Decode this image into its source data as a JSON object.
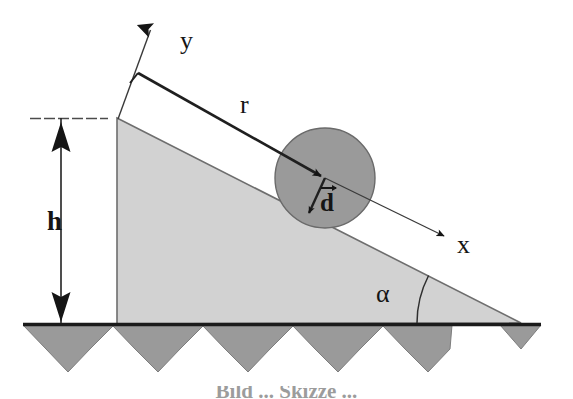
{
  "figure": {
    "background_color": "#ffffff",
    "width": 573,
    "height": 399
  },
  "labels": {
    "y_axis": "y",
    "x_axis": "x",
    "radius": "r",
    "height": "h",
    "angle": "α",
    "displacement": "d"
  },
  "caption": {
    "text": "Bild ... Skizze ...",
    "note": "cropped at bottom edge, only tops of glyphs visible"
  },
  "colors": {
    "ink": "#151515",
    "wedge_fill": "#d2d2d2",
    "wedge_stroke": "#6e6e6e",
    "sphere_fill": "#9a9a9a",
    "sphere_stroke": "#6a6a6a",
    "hatch_fill": "#9a9a9a",
    "hatch_stroke": "#7d7d7d",
    "ground_line": "#1b1b1b",
    "dim_line": "#2a2a2a",
    "guide_line": "#585858"
  },
  "geometry": {
    "wedge": {
      "apex": [
        117,
        118
      ],
      "bottom_left": [
        117,
        324
      ],
      "bottom_right": [
        521,
        323
      ],
      "angle_deg": 27
    },
    "ground_line": {
      "x1": 23,
      "y1": 324,
      "x2": 541,
      "y2": 324
    },
    "hatch_band": {
      "top_left": [
        23,
        325
      ],
      "top_right": [
        541,
        325
      ],
      "teeth": 5,
      "tooth_depth": 46
    },
    "sphere": {
      "cx": 325,
      "cy": 178,
      "r": 50
    },
    "x_axis": {
      "from": [
        138,
        73
      ],
      "to": [
        448,
        238
      ],
      "arrow_at": "to"
    },
    "y_axis": {
      "from": [
        118,
        118
      ],
      "to": [
        152,
        22
      ],
      "arrow_at": "to"
    },
    "r_vector": {
      "from": [
        138,
        73
      ],
      "to": [
        325,
        178
      ],
      "arrow_at": "to"
    },
    "d_vector": {
      "from": [
        325,
        178
      ],
      "to": [
        307,
        217
      ],
      "arrow_at": "to"
    },
    "height_dim": {
      "x": 61,
      "top": 118,
      "bottom": 323,
      "tick_line": {
        "x1": 30,
        "y1": 118,
        "x2": 108,
        "y2": 118
      }
    },
    "angle_arc": {
      "vertex": [
        521,
        323
      ],
      "radius": 104,
      "from_deg": 180,
      "to_deg": 207
    }
  }
}
